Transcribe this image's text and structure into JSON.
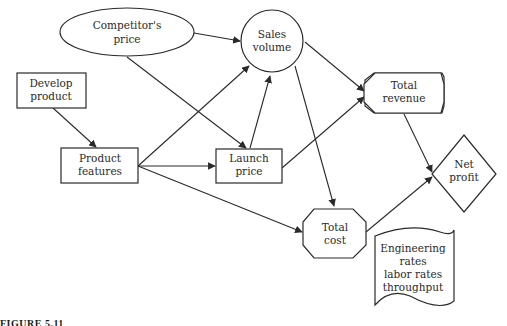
{
  "diagram": {
    "type": "influence-diagram",
    "nodes": {
      "competitors_price": {
        "shape": "ellipse",
        "lines": [
          "Competitor's",
          "price"
        ]
      },
      "sales_volume": {
        "shape": "circle",
        "lines": [
          "Sales",
          "volume"
        ]
      },
      "develop_product": {
        "shape": "rectangle",
        "lines": [
          "Develop",
          "product"
        ]
      },
      "product_features": {
        "shape": "rectangle",
        "lines": [
          "Product",
          "features"
        ]
      },
      "launch_price": {
        "shape": "rectangle",
        "lines": [
          "Launch",
          "price"
        ]
      },
      "total_revenue": {
        "shape": "octagon",
        "lines": [
          "Total",
          "revenue"
        ]
      },
      "total_cost": {
        "shape": "octagon",
        "lines": [
          "Total",
          "cost"
        ]
      },
      "net_profit": {
        "shape": "diamond",
        "lines": [
          "Net",
          "profit"
        ]
      },
      "cost_data": {
        "shape": "document",
        "lines": [
          "Engineering",
          "rates",
          "labor rates",
          "throughput"
        ]
      }
    },
    "edges": [
      {
        "from": "Competitor's price",
        "to": "Sales volume"
      },
      {
        "from": "Competitor's price",
        "to": "Launch price"
      },
      {
        "from": "Develop product",
        "to": "Product features"
      },
      {
        "from": "Product features",
        "to": "Sales volume"
      },
      {
        "from": "Product features",
        "to": "Launch price"
      },
      {
        "from": "Product features",
        "to": "Total cost"
      },
      {
        "from": "Launch price",
        "to": "Sales volume"
      },
      {
        "from": "Launch price",
        "to": "Total revenue"
      },
      {
        "from": "Sales volume",
        "to": "Total revenue"
      },
      {
        "from": "Sales volume",
        "to": "Total cost"
      },
      {
        "from": "Total revenue",
        "to": "Net profit"
      },
      {
        "from": "Total cost",
        "to": "Net profit"
      }
    ]
  },
  "caption": "FIGURE 5.11"
}
